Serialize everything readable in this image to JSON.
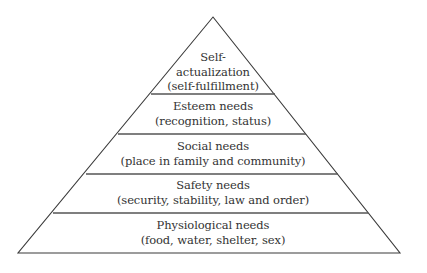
{
  "diagram": {
    "type": "pyramid",
    "levels": [
      {
        "title": "Self-",
        "title2": "actualization",
        "subtitle": "(self-fulfillment)"
      },
      {
        "title": "Esteem needs",
        "subtitle": "(recognition, status)"
      },
      {
        "title": "Social needs",
        "subtitle": "(place in family and community)"
      },
      {
        "title": "Safety needs",
        "subtitle": "(security, stability, law and order)"
      },
      {
        "title": "Physiological needs",
        "subtitle": "(food, water, shelter, sex)"
      }
    ],
    "colors": {
      "line": "#3a3a3a",
      "text": "#333333",
      "background": "#ffffff"
    }
  }
}
